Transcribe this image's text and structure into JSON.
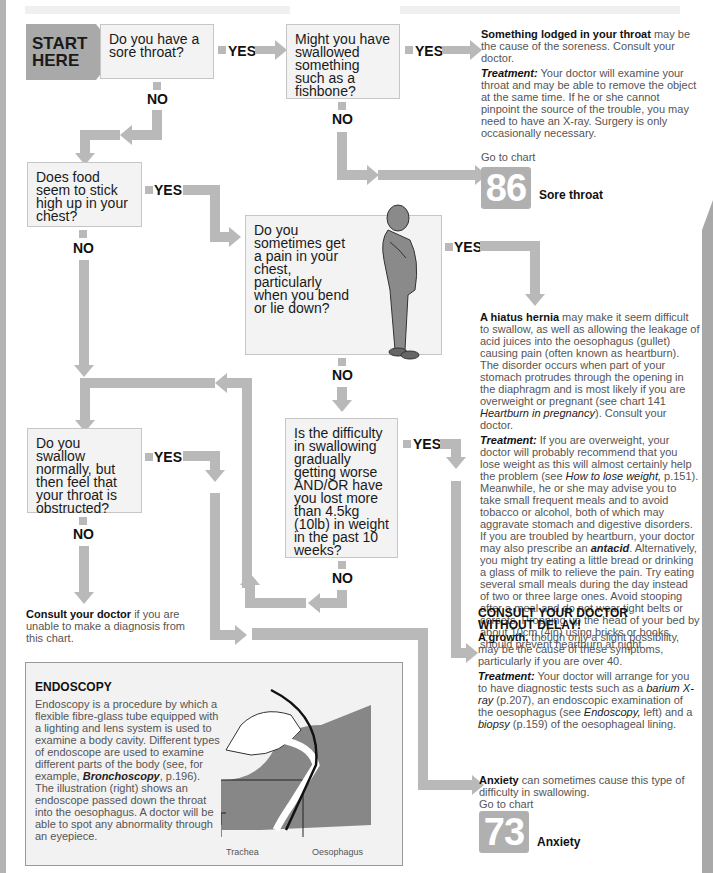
{
  "start": {
    "label_line1": "START",
    "label_line2": "HERE"
  },
  "labels": {
    "yes": "YES",
    "no": "NO"
  },
  "questions": {
    "q1": "Do you have a sore throat?",
    "q2": "Might you have swallowed something such as a fishbone?",
    "q3": "Does food seem to stick high up in your chest?",
    "q4": "Do you sometimes get a pain in your chest, particularly when you bend or lie down?",
    "q5": "Is the difficulty in swallowing gradually getting worse AND/OR have you lost more than 4.5kg (10lb) in weight in the past 10 weeks?",
    "q6": "Do you swallow normally, but then feel that your throat is obstructed?"
  },
  "outcomes": {
    "lodged": {
      "title": "Something lodged in your throat",
      "text": " may be the cause of the soreness. Consult your doctor.",
      "treatment_label": "Treatment:",
      "treatment": " Your doctor will examine your throat and may be able to remove the object at the same time. If he or she cannot pinpoint the source of the trouble, you may need to have an X-ray. Surgery is only occasionally necessary."
    },
    "sore_throat": {
      "goto": "Go to chart",
      "number": "86",
      "name": "Sore throat"
    },
    "hiatus": {
      "title": "A hiatus hernia",
      "text": " may make it seem difficult to swallow, as well as allowing the leakage of acid juices into the oesophagus (gullet) causing pain (often known as heartburn). The disorder occurs when part of your stomach protrudes through the opening in the diaphragm and is most likely if you are overweight or pregnant (see chart 141 ",
      "ref": "Heartburn in pregnancy",
      "text2": "). Consult your doctor.",
      "treatment_label": "Treatment:",
      "treatment_a": " If you are overweight, your doctor will probably recommend that you lose weight as this will almost certainly help the problem (see ",
      "treatment_ref": "How to lose weight,",
      "treatment_b": " p.151). Meanwhile, he or she may advise you to take small frequent meals and to avoid tobacco or alcohol, both of which may aggravate stomach and digestive disorders. If you are troubled by heartburn, your doctor may also prescribe an ",
      "treatment_ref2": "antacid",
      "treatment_c": ". Alternatively, you might try eating a little bread or drinking a glass of milk to relieve the pain. Try eating several small meals during the day instead of two or three large ones. Avoid stooping after a meal and do not wear tight belts or corsets. Propping up the head of your bed by about 10cm (4in) using bricks or books should prevent heartburn at night."
    },
    "growth": {
      "heading_line1": "CONSULT YOUR DOCTOR",
      "heading_line2": "WITHOUT DELAY!",
      "title": "A growth,",
      "text": " though only a slight possibility, may be the cause of these symptoms, particularly if you are over 40.",
      "treatment_label": "Treatment:",
      "treatment_a": " Your doctor will arrange for you to have diagnostic tests such as a ",
      "ref1": "barium X-ray",
      "treatment_b": " (p.207), an endoscopic examination of the oesophagus (see ",
      "ref2": "Endoscopy,",
      "treatment_c": " left) and a ",
      "ref3": "biopsy",
      "treatment_d": " (p.159) of the oesophageal lining."
    },
    "consult": {
      "title": "Consult your doctor",
      "text": " if you are unable to make a diagnosis from this chart."
    },
    "anxiety": {
      "title": "Anxiety",
      "text": " can sometimes cause this type of difficulty in swallowing.",
      "goto": "Go to chart",
      "number": "73",
      "name": "Anxiety"
    }
  },
  "endoscopy": {
    "title": "ENDOSCOPY",
    "text_a": "Endoscopy is a procedure by which a flexible fibre-glass tube equipped with a lighting and lens system is used to examine a body cavity. Different types of endoscope are used to examine different parts of the body (see, for example, ",
    "ref": "Bronchoscopy",
    "text_b": ", p.196). The illustration (right) shows an endoscope passed down the throat into the oesophagus. A doctor will be able to spot any abnormality through an eyepiece.",
    "label_trachea": "Trachea",
    "label_oesophagus": "Oesophagus"
  },
  "colors": {
    "pipe": "#b9b9b9",
    "box_bg": "#f3f3f3",
    "chart_badge": "#b0b0b0"
  }
}
